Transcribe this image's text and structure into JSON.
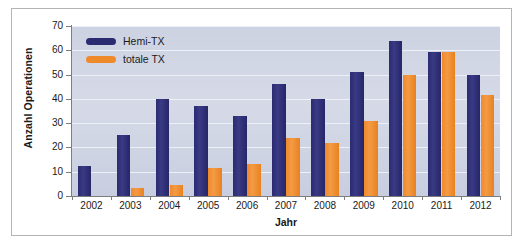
{
  "chart_data": {
    "type": "bar",
    "title": "",
    "xlabel": "Jahr",
    "ylabel": "Anzahl Operationen",
    "categories": [
      "2002",
      "2003",
      "2004",
      "2005",
      "2006",
      "2007",
      "2008",
      "2009",
      "2010",
      "2011",
      "2012"
    ],
    "series": [
      {
        "name": "Hemi-TX",
        "color": "#2b2b72",
        "values": [
          12.5,
          25,
          40,
          37,
          33,
          46,
          40,
          51,
          64,
          59.5,
          50
        ]
      },
      {
        "name": "totale TX",
        "color": "#ef8a2a",
        "values": [
          0,
          3.5,
          4.5,
          11.5,
          13,
          24,
          22,
          31,
          50,
          59.5,
          41.5
        ]
      }
    ],
    "ylim": [
      0,
      70
    ],
    "yticks": [
      0,
      10,
      20,
      30,
      40,
      50,
      60,
      70
    ],
    "ytick_labels": [
      "0",
      "10",
      "20",
      "30",
      "40",
      "50",
      "60",
      "70"
    ],
    "grid": true,
    "legend_position": "top-left",
    "plot_background": "#d2d7e4",
    "figure_background": "#ffffff",
    "frame_color": "#b4b4b4"
  },
  "legend": {
    "entries": [
      {
        "label": "Hemi-TX",
        "swatch": "hemi"
      },
      {
        "label": "totale TX",
        "swatch": "totale"
      }
    ]
  }
}
